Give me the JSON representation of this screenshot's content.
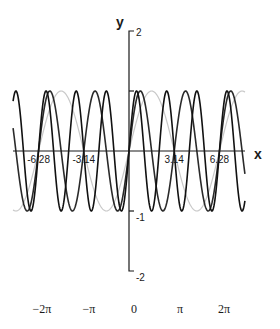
{
  "chart_data": {
    "type": "line",
    "title": "",
    "xlabel": "x",
    "ylabel": "y",
    "xlim": [
      -8.05,
      8.05
    ],
    "ylim": [
      -2,
      2
    ],
    "grid": false,
    "legend": "none",
    "x_tick_labels": [
      {
        "value": -6.28,
        "label": "-6.28"
      },
      {
        "value": -3.14,
        "label": "-3.14"
      },
      {
        "value": 3.14,
        "label": "3.14"
      },
      {
        "value": 6.28,
        "label": "6.28"
      }
    ],
    "y_tick_labels": [
      {
        "value": 2,
        "label": "2"
      },
      {
        "value": 1,
        "label": ""
      },
      {
        "value": -1,
        "label": "-1"
      },
      {
        "value": -2,
        "label": "-2"
      }
    ],
    "series": [
      {
        "name": "sin(x)",
        "function": "sin(1x)",
        "frequency": 1,
        "amplitude": 1,
        "color": "#c8c8c8",
        "width": 1.2
      },
      {
        "name": "sin(2x)",
        "function": "sin(2x)",
        "frequency": 2,
        "amplitude": 1,
        "color": "#2a2a2a",
        "width": 1.6
      },
      {
        "name": "sin(3x)",
        "function": "sin(3x)",
        "frequency": 3,
        "amplitude": 1,
        "color": "#111111",
        "width": 1.6
      }
    ],
    "pi_labels": [
      {
        "value": -6.2832,
        "label": "−2π"
      },
      {
        "value": -3.1416,
        "label": "−π"
      },
      {
        "value": 0,
        "label": "0"
      },
      {
        "value": 3.1416,
        "label": "π"
      },
      {
        "value": 6.2832,
        "label": "2π"
      }
    ]
  },
  "layout": {
    "origin_x": 129,
    "origin_y": 151,
    "px_per_x": 14.4,
    "px_per_y": 60,
    "x_axis_start": 13,
    "x_axis_end": 245
  }
}
